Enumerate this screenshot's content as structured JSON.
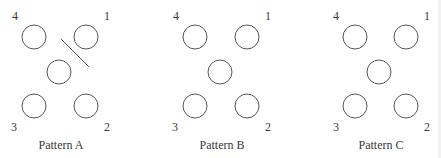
{
  "patterns": [
    {
      "id": "A",
      "caption": "Pattern A",
      "corner_labels": {
        "top_left": "4",
        "top_right": "1",
        "bottom_left": "3",
        "bottom_right": "2"
      },
      "holes": 5,
      "has_slash": true
    },
    {
      "id": "B",
      "caption": "Pattern B",
      "corner_labels": {
        "top_left": "4",
        "top_right": "1",
        "bottom_left": "3",
        "bottom_right": "2"
      },
      "holes": 5,
      "has_slash": false
    },
    {
      "id": "C",
      "caption": "Pattern C",
      "corner_labels": {
        "top_left": "4",
        "top_right": "1",
        "bottom_left": "3",
        "bottom_right": "2"
      },
      "holes": 5,
      "has_slash": false
    }
  ],
  "colors": {
    "stroke": "#555555",
    "text": "#3a3a3a"
  }
}
